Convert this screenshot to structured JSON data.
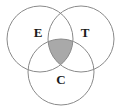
{
  "diagram": {
    "type": "venn",
    "title": "",
    "canvas": {
      "width": 121,
      "height": 111,
      "background": "#ffffff"
    },
    "stroke": {
      "color": "#8a8a8a",
      "width": 1
    },
    "shaded_region": {
      "name": "triple-intersection",
      "sets": [
        "E",
        "T",
        "C"
      ],
      "fill": "#a9a9a9"
    },
    "sets": [
      {
        "key": "E",
        "label": "E",
        "label_x": 38,
        "label_y": 34,
        "cx": 40,
        "cy": 39,
        "r": 33
      },
      {
        "key": "T",
        "label": "T",
        "label_x": 85,
        "label_y": 34,
        "cx": 81,
        "cy": 39,
        "r": 33
      },
      {
        "key": "C",
        "label": "C",
        "label_x": 61,
        "label_y": 81,
        "cx": 61,
        "cy": 72,
        "r": 33
      }
    ]
  }
}
